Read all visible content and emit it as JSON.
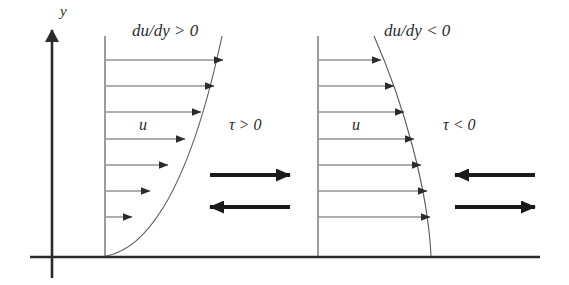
{
  "figure": {
    "background_color": "#ffffff",
    "line_color": "#3a3a3a",
    "axis_color": "#2b2b2b",
    "bold_arrow_color": "#1a1a1a",
    "axis": {
      "y_label": "y",
      "y_axis_x": 52,
      "y_axis_top": 28,
      "y_axis_bottom": 278,
      "baseline_y": 257,
      "baseline_left": 30,
      "baseline_right": 540
    },
    "panels": [
      {
        "id": "panel-positive-shear",
        "gradient_label": "du/dy > 0",
        "velocity_label": "u",
        "stress_label": "τ > 0",
        "profile_shape": "concave-up",
        "wall_x": 105,
        "profile_top_x": 222,
        "profile_top_y": 36,
        "arrow_count": 7,
        "arrow_lengths": [
          117,
          108,
          95,
          79,
          62,
          44,
          26
        ],
        "arrow_y": [
          60,
          86,
          112,
          139,
          165,
          191,
          217
        ],
        "stress_arrows": [
          {
            "direction": "right",
            "y": 175,
            "x1": 210,
            "x2": 290
          },
          {
            "direction": "left",
            "y": 207,
            "x1": 210,
            "x2": 290
          }
        ]
      },
      {
        "id": "panel-negative-shear",
        "gradient_label": "du/dy < 0",
        "velocity_label": "u",
        "stress_label": "τ < 0",
        "profile_shape": "convex-right",
        "wall_x": 318,
        "profile_top_x": 374,
        "profile_top_y": 36,
        "arrow_count": 7,
        "arrow_lengths": [
          27,
          46,
          62,
          78,
          91,
          101,
          108
        ],
        "arrow_y": [
          60,
          86,
          112,
          139,
          165,
          191,
          217
        ],
        "stress_arrows": [
          {
            "direction": "left",
            "y": 175,
            "x1": 455,
            "x2": 535
          },
          {
            "direction": "right",
            "y": 207,
            "x1": 455,
            "x2": 535
          }
        ]
      }
    ]
  }
}
